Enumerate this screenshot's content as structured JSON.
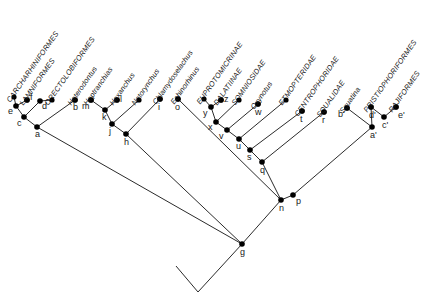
{
  "figure": {
    "type": "cladogram",
    "title": "",
    "background_color": "#ffffff",
    "line_color": "#2b2b2b",
    "node_color": "#000000"
  },
  "taxa": [
    {
      "id": "t1",
      "label": "CARCHARHINIFORMES",
      "style": "caps",
      "tip_x": 14,
      "tip_y": 97,
      "label_x": 12,
      "label_y": 95
    },
    {
      "id": "t2",
      "label": "LAMNIFORMES",
      "style": "caps",
      "tip_x": 27,
      "tip_y": 100,
      "label_x": 25,
      "label_y": 98
    },
    {
      "id": "t3",
      "label": "ORECTOLOBIFORMES",
      "style": "caps",
      "tip_x": 52,
      "tip_y": 100,
      "label_x": 50,
      "label_y": 98
    },
    {
      "id": "t4",
      "label": "Heterodontus",
      "style": "genus",
      "tip_x": 75,
      "tip_y": 100,
      "label_x": 73,
      "label_y": 98
    },
    {
      "id": "t5",
      "label": "Heptranchias",
      "style": "genus",
      "tip_x": 91,
      "tip_y": 100,
      "label_x": 89,
      "label_y": 98
    },
    {
      "id": "t6",
      "label": "Hexanchus",
      "style": "genus",
      "tip_x": 117,
      "tip_y": 100,
      "label_x": 115,
      "label_y": 98
    },
    {
      "id": "t7",
      "label": "Notorynchus",
      "style": "genus",
      "tip_x": 139,
      "tip_y": 100,
      "label_x": 137,
      "label_y": 98
    },
    {
      "id": "t8",
      "label": "Chlamydoselachus",
      "style": "genus",
      "tip_x": 160,
      "tip_y": 99,
      "label_x": 158,
      "label_y": 97
    },
    {
      "id": "t9",
      "label": "Echinorhinus",
      "style": "genus",
      "tip_x": 178,
      "tip_y": 99,
      "label_x": 176,
      "label_y": 97
    },
    {
      "id": "t10",
      "label": "EUPROTOMICRINAE",
      "style": "caps",
      "tip_x": 204,
      "tip_y": 99,
      "label_x": 202,
      "label_y": 97
    },
    {
      "id": "t11",
      "label": "DALATIINAE",
      "style": "caps",
      "tip_x": 221,
      "tip_y": 100,
      "label_x": 219,
      "label_y": 98
    },
    {
      "id": "t12",
      "label": "SOMNIOSIDAE",
      "style": "caps",
      "tip_x": 239,
      "tip_y": 100,
      "label_x": 237,
      "label_y": 98
    },
    {
      "id": "t13",
      "label": "Oxynotus",
      "style": "genus",
      "tip_x": 258,
      "tip_y": 104,
      "label_x": 256,
      "label_y": 102
    },
    {
      "id": "t14",
      "label": "ETMOPTERIDAE",
      "style": "caps",
      "tip_x": 286,
      "tip_y": 100,
      "label_x": 284,
      "label_y": 98
    },
    {
      "id": "t15",
      "label": "CENTROPHORIDAE",
      "style": "caps",
      "tip_x": 302,
      "tip_y": 111,
      "label_x": 300,
      "label_y": 109
    },
    {
      "id": "t16",
      "label": "SQUALIDAE",
      "style": "caps",
      "tip_x": 324,
      "tip_y": 112,
      "label_x": 322,
      "label_y": 110
    },
    {
      "id": "t17",
      "label": "Squatina",
      "style": "genus",
      "tip_x": 347,
      "tip_y": 108,
      "label_x": 345,
      "label_y": 106
    },
    {
      "id": "t18",
      "label": "PRISTIOPHORIFORMES",
      "style": "caps",
      "tip_x": 371,
      "tip_y": 107,
      "label_x": 369,
      "label_y": 105
    },
    {
      "id": "t19",
      "label": "RAJIFORMES",
      "style": "caps",
      "tip_x": 396,
      "tip_y": 107,
      "label_x": 394,
      "label_y": 105
    }
  ],
  "internal_nodes": [
    {
      "id": "e",
      "label": "e",
      "x": 16,
      "y": 106,
      "label_dx": -8,
      "label_dy": 8
    },
    {
      "id": "f",
      "label": "f",
      "x": 27,
      "y": 100,
      "label_dx": 3,
      "label_dy": 0
    },
    {
      "id": "c",
      "label": "c",
      "x": 24,
      "y": 117,
      "label_dx": -7,
      "label_dy": 9
    },
    {
      "id": "d",
      "label": "d",
      "x": 40,
      "y": 101,
      "label_dx": 2,
      "label_dy": 8
    },
    {
      "id": "b",
      "label": "b",
      "x": 75,
      "y": 100,
      "label_dx": -2,
      "label_dy": 10
    },
    {
      "id": "a",
      "label": "a",
      "x": 37,
      "y": 127,
      "label_dx": -2,
      "label_dy": 10
    },
    {
      "id": "m",
      "label": "m",
      "x": 91,
      "y": 100,
      "label_dx": -9,
      "label_dy": 9
    },
    {
      "id": "k",
      "label": "k",
      "x": 105,
      "y": 110,
      "label_dx": -3,
      "label_dy": 10
    },
    {
      "id": "l",
      "label": "l",
      "x": 117,
      "y": 100,
      "label_dx": 3,
      "label_dy": 2
    },
    {
      "id": "j",
      "label": "j",
      "x": 112,
      "y": 124,
      "label_dx": -3,
      "label_dy": 10
    },
    {
      "id": "h",
      "label": "h",
      "x": 126,
      "y": 134,
      "label_dx": -2,
      "label_dy": 11
    },
    {
      "id": "i",
      "label": "i",
      "x": 160,
      "y": 99,
      "label_dx": -2,
      "label_dy": 11
    },
    {
      "id": "o",
      "label": "o",
      "x": 178,
      "y": 99,
      "label_dx": -3,
      "label_dy": 11
    },
    {
      "id": "z",
      "label": "z",
      "x": 221,
      "y": 100,
      "label_dx": 3,
      "label_dy": 2
    },
    {
      "id": "y",
      "label": "y",
      "x": 211,
      "y": 107,
      "label_dx": -8,
      "label_dy": 9
    },
    {
      "id": "x",
      "label": "x",
      "x": 216,
      "y": 122,
      "label_dx": -8,
      "label_dy": 8
    },
    {
      "id": "v",
      "label": "v",
      "x": 227,
      "y": 130,
      "label_dx": -8,
      "label_dy": 9
    },
    {
      "id": "w",
      "label": "w",
      "x": 258,
      "y": 104,
      "label_dx": -3,
      "label_dy": 11
    },
    {
      "id": "u",
      "label": "u",
      "x": 239,
      "y": 139,
      "label_dx": -3,
      "label_dy": 10
    },
    {
      "id": "s",
      "label": "s",
      "x": 250,
      "y": 150,
      "label_dx": -3,
      "label_dy": 10
    },
    {
      "id": "q",
      "label": "q",
      "x": 262,
      "y": 162,
      "label_dx": -2,
      "label_dy": 11
    },
    {
      "id": "t",
      "label": "t",
      "x": 302,
      "y": 111,
      "label_dx": -2,
      "label_dy": 11
    },
    {
      "id": "r",
      "label": "r",
      "x": 324,
      "y": 112,
      "label_dx": -2,
      "label_dy": 11
    },
    {
      "id": "p",
      "label": "p",
      "x": 293,
      "y": 195,
      "label_dx": 3,
      "label_dy": 9
    },
    {
      "id": "n",
      "label": "n",
      "x": 281,
      "y": 200,
      "label_dx": -2,
      "label_dy": 11
    },
    {
      "id": "g",
      "label": "g",
      "x": 242,
      "y": 244,
      "label_dx": -2,
      "label_dy": 11
    },
    {
      "id": "bp",
      "label": "b'",
      "x": 347,
      "y": 108,
      "label_dx": -9,
      "label_dy": 9
    },
    {
      "id": "dp",
      "label": "d'",
      "x": 371,
      "y": 107,
      "label_dx": -2,
      "label_dy": 11
    },
    {
      "id": "cp",
      "label": "c'",
      "x": 384,
      "y": 117,
      "label_dx": -2,
      "label_dy": 11
    },
    {
      "id": "ep",
      "label": "e'",
      "x": 396,
      "y": 107,
      "label_dx": 2,
      "label_dy": 11
    },
    {
      "id": "ap",
      "label": "a'",
      "x": 372,
      "y": 127,
      "label_dx": -2,
      "label_dy": 11
    }
  ],
  "edges": [
    {
      "from": "e",
      "to": "t1"
    },
    {
      "from": "e",
      "to": "f"
    },
    {
      "from": "c",
      "to": "e"
    },
    {
      "from": "f",
      "to": "t2"
    },
    {
      "from": "c",
      "to": "d"
    },
    {
      "from": "d",
      "to": "t3"
    },
    {
      "from": "a",
      "to": "c"
    },
    {
      "from": "a",
      "to": "b"
    },
    {
      "from": "b",
      "to": "t4"
    },
    {
      "from": "k",
      "to": "m"
    },
    {
      "from": "m",
      "to": "t5"
    },
    {
      "from": "k",
      "to": "l"
    },
    {
      "from": "l",
      "to": "t6"
    },
    {
      "from": "j",
      "to": "k"
    },
    {
      "from": "j",
      "to": "t7"
    },
    {
      "from": "h",
      "to": "j"
    },
    {
      "from": "h",
      "to": "i"
    },
    {
      "from": "i",
      "to": "t8"
    },
    {
      "from": "g",
      "to": "a"
    },
    {
      "from": "g",
      "to": "h"
    },
    {
      "from": "n",
      "to": "o"
    },
    {
      "from": "o",
      "to": "t9"
    },
    {
      "from": "y",
      "to": "t10"
    },
    {
      "from": "y",
      "to": "z"
    },
    {
      "from": "z",
      "to": "t11"
    },
    {
      "from": "x",
      "to": "y"
    },
    {
      "from": "x",
      "to": "t12"
    },
    {
      "from": "v",
      "to": "x"
    },
    {
      "from": "v",
      "to": "w"
    },
    {
      "from": "w",
      "to": "t13"
    },
    {
      "from": "u",
      "to": "v"
    },
    {
      "from": "u",
      "to": "t14"
    },
    {
      "from": "s",
      "to": "u"
    },
    {
      "from": "s",
      "to": "t"
    },
    {
      "from": "t",
      "to": "t15"
    },
    {
      "from": "q",
      "to": "s"
    },
    {
      "from": "q",
      "to": "r"
    },
    {
      "from": "r",
      "to": "t16"
    },
    {
      "from": "n",
      "to": "q"
    },
    {
      "from": "p",
      "to": "n"
    },
    {
      "from": "p",
      "to": "ap"
    },
    {
      "from": "ap",
      "to": "bp"
    },
    {
      "from": "ap",
      "to": "dp"
    },
    {
      "from": "dp",
      "to": "t18"
    },
    {
      "from": "bp",
      "to": "t17"
    },
    {
      "from": "dp",
      "to": "cp"
    },
    {
      "from": "cp",
      "to": "ep"
    },
    {
      "from": "ep",
      "to": "t19"
    },
    {
      "from": "g",
      "to": "n"
    }
  ],
  "root": {
    "fork_x": 198,
    "fork_y": 292,
    "left_tip_x": 176,
    "left_tip_y": 266
  }
}
